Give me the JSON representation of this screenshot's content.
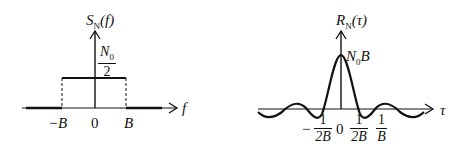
{
  "diagram": {
    "left_plot": {
      "title": "S_N(f)",
      "title_main": "S",
      "title_sub": "N",
      "title_arg": "(f)",
      "level_label_num": "N",
      "level_label_num_sub": "0",
      "level_label_den": "2",
      "x_axis_label": "f",
      "ticks": [
        "−B",
        "0",
        "B"
      ]
    },
    "right_plot": {
      "title": "R_N(τ)",
      "title_main": "R",
      "title_sub": "N",
      "title_arg": "(τ)",
      "peak_label_a": "N",
      "peak_label_sub": "0",
      "peak_label_b": "B",
      "x_axis_label": "τ",
      "ticks": {
        "neg_sign": "−",
        "neg_num": "1",
        "neg_den": "2B",
        "zero": "0",
        "pos1_num": "1",
        "pos1_den": "2B",
        "pos2_num": "1",
        "pos2_den": "B"
      }
    },
    "colors": {
      "line": "#111111",
      "background": "#ffffff"
    }
  }
}
